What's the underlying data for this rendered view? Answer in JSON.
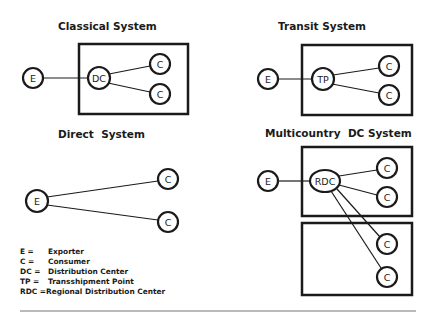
{
  "diagrams": {
    "classical": {
      "title": "Classical System",
      "nodes": {
        "exporter": "E",
        "hub": "DC",
        "consumer1": "C",
        "consumer2": "C"
      }
    },
    "transit": {
      "title": "Transit System",
      "nodes": {
        "exporter": "E",
        "hub": "TP",
        "consumer1": "C",
        "consumer2": "C"
      }
    },
    "direct": {
      "title": "Direct  System",
      "nodes": {
        "exporter": "E",
        "consumer1": "C",
        "consumer2": "C"
      }
    },
    "multicountry": {
      "title": "Multicountry  DC System",
      "nodes": {
        "exporter": "E",
        "hub": "RDC",
        "consumer1": "C",
        "consumer2": "C",
        "consumer3": "C",
        "consumer4": "C"
      }
    }
  },
  "legend": {
    "items": [
      {
        "abbr": "E =",
        "meaning": "Exporter"
      },
      {
        "abbr": "C =",
        "meaning": "Consumer"
      },
      {
        "abbr": "DC =",
        "meaning": "Distribution Center"
      },
      {
        "abbr": "TP =",
        "meaning": "Transshipment Point"
      },
      {
        "abbr": "RDC =",
        "meaning": "Regional Distribution Center"
      }
    ]
  },
  "colors": {
    "ink": "#1a1a1a",
    "rule": "#777777",
    "background": "#ffffff"
  }
}
